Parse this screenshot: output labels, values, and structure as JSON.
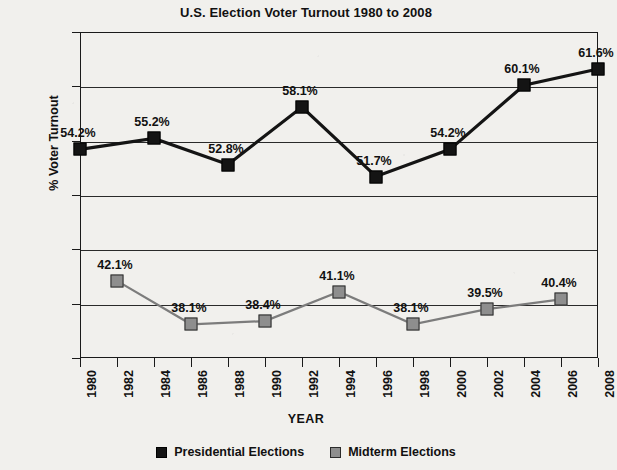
{
  "chart_data": {
    "type": "line",
    "title": "U.S. Election Voter Turnout 1980 to 2008",
    "xlabel": "YEAR",
    "ylabel": "% Voter Turnout",
    "ylim": [
      35,
      65
    ],
    "ytick_step": 5,
    "ytick_labels": [
      "65%",
      "60%",
      "55%",
      "50%",
      "45%",
      "40%",
      "35%"
    ],
    "ytick_values": [
      65,
      60,
      55,
      50,
      45,
      40,
      35
    ],
    "xlim": [
      1980,
      2008
    ],
    "x": [
      1980,
      1982,
      1984,
      1986,
      1988,
      1990,
      1992,
      1994,
      1996,
      1998,
      2000,
      2002,
      2004,
      2006,
      2008
    ],
    "xtick_labels": [
      "1980",
      "1982",
      "1984",
      "1986",
      "1988",
      "1990",
      "1992",
      "1994",
      "1996",
      "1998",
      "2000",
      "2002",
      "2004",
      "2006",
      "2008"
    ],
    "grid": true,
    "legend_position": "bottom",
    "series": [
      {
        "name": "Presidential Elections",
        "color": "#141414",
        "marker": "filled-square",
        "points": [
          {
            "x": 1980,
            "y": 54.2,
            "label": "54.2%"
          },
          {
            "x": 1984,
            "y": 55.2,
            "label": "55.2%"
          },
          {
            "x": 1988,
            "y": 52.8,
            "label": "52.8%"
          },
          {
            "x": 1992,
            "y": 58.1,
            "label": "58.1%"
          },
          {
            "x": 1996,
            "y": 51.7,
            "label": "51.7%"
          },
          {
            "x": 2000,
            "y": 54.2,
            "label": "54.2%"
          },
          {
            "x": 2004,
            "y": 60.1,
            "label": "60.1%"
          },
          {
            "x": 2008,
            "y": 61.6,
            "label": "61.6%"
          }
        ]
      },
      {
        "name": "Midterm Elections",
        "color": "#8e8e8e",
        "marker": "gray-square",
        "points": [
          {
            "x": 1982,
            "y": 42.1,
            "label": "42.1%"
          },
          {
            "x": 1986,
            "y": 38.1,
            "label": "38.1%"
          },
          {
            "x": 1990,
            "y": 38.4,
            "label": "38.4%"
          },
          {
            "x": 1994,
            "y": 41.1,
            "label": "41.1%"
          },
          {
            "x": 1998,
            "y": 38.1,
            "label": "38.1%"
          },
          {
            "x": 2002,
            "y": 39.5,
            "label": "39.5%"
          },
          {
            "x": 2006,
            "y": 40.4,
            "label": "40.4%"
          }
        ]
      }
    ],
    "legend": [
      {
        "label": "Presidential Elections",
        "swatch": "presidential"
      },
      {
        "label": "Midterm Elections",
        "swatch": "midterm"
      }
    ]
  }
}
